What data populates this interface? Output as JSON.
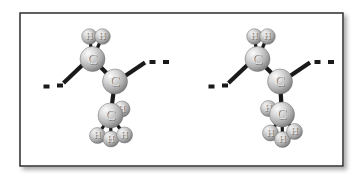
{
  "figure": {
    "name": "molecular-model-figure",
    "caption": "",
    "frame": {
      "x": 20,
      "y": 13,
      "width": 323,
      "height": 153,
      "border_color": "#2b2b2b",
      "border_width": 1.5,
      "background": "#ffffff",
      "shadow_color": "#b9b9b9"
    },
    "atom_colors": {
      "carbon_light": "#f2f2f2",
      "carbon_mid": "#bdbdbd",
      "carbon_dark": "#7a7a7a",
      "hydrogen_light": "#ededed",
      "hydrogen_mid": "#b5b5b5",
      "hydrogen_dark": "#777777",
      "bond": "#1a1a1a",
      "label": "#e8e8e8",
      "label_shadow": "#6f6f6f"
    }
  },
  "molecules": [
    {
      "id": "molecule-left",
      "label": "left-conformer",
      "atoms": [
        {
          "id": "h-top-left",
          "element": "H",
          "cx": 89.5,
          "cy": 36.5,
          "r": 7.8
        },
        {
          "id": "h-top-right",
          "element": "H",
          "cx": 102.5,
          "cy": 36.5,
          "r": 7.8
        },
        {
          "id": "c-upper",
          "element": "C",
          "cx": 92.5,
          "cy": 59.0,
          "r": 12.5
        },
        {
          "id": "c-center",
          "element": "C",
          "cx": 115.0,
          "cy": 81.5,
          "r": 12.5
        },
        {
          "id": "h-methyl-side",
          "element": "H",
          "cx": 122.0,
          "cy": 109.0,
          "r": 8.0
        },
        {
          "id": "c-lower",
          "element": "C",
          "cx": 110.5,
          "cy": 115.5,
          "r": 12.5
        },
        {
          "id": "h-bottom-left",
          "element": "H",
          "cx": 97.5,
          "cy": 135.5,
          "r": 8.0
        },
        {
          "id": "h-bottom-mid",
          "element": "H",
          "cx": 111.0,
          "cy": 139.0,
          "r": 8.0
        },
        {
          "id": "h-bottom-right",
          "element": "H",
          "cx": 124.5,
          "cy": 135.0,
          "r": 8.0
        }
      ],
      "bonds": [
        {
          "id": "bond-c-upper-h-left",
          "from": "c-upper",
          "to": "h-top-left",
          "width": 3.2
        },
        {
          "id": "bond-c-upper-h-right",
          "from": "c-upper",
          "to": "h-top-right",
          "width": 3.2
        },
        {
          "id": "bond-c-upper-c-center",
          "from": "c-upper",
          "to": "c-center",
          "width": 4.2
        },
        {
          "id": "bond-c-center-c-lower",
          "from": "c-center",
          "to": "c-lower",
          "width": 4.2
        },
        {
          "id": "bond-c-lower-h-side",
          "from": "c-lower",
          "to": "h-methyl-side",
          "width": 3.2
        },
        {
          "id": "bond-c-lower-h-bl",
          "from": "c-lower",
          "to": "h-bottom-left",
          "width": 3.2
        },
        {
          "id": "bond-c-lower-h-bm",
          "from": "c-lower",
          "to": "h-bottom-mid",
          "width": 3.2
        },
        {
          "id": "bond-c-lower-h-br",
          "from": "c-lower",
          "to": "h-bottom-right",
          "width": 3.2
        }
      ],
      "chain_bonds": [
        {
          "id": "chain-bond-left",
          "stub": {
            "x1": 83.0,
            "y1": 64.5,
            "x2": 63.5,
            "y2": 83.0,
            "width": 4.2
          },
          "dashes": [
            {
              "x": 57.0,
              "y": 83.5,
              "w": 6.0,
              "h": 4.0
            },
            {
              "x": 43.5,
              "y": 84.5,
              "w": 6.0,
              "h": 4.0
            }
          ]
        },
        {
          "id": "chain-bond-right",
          "stub": {
            "x1": 125.0,
            "y1": 76.0,
            "x2": 145.0,
            "y2": 62.5,
            "width": 4.2
          },
          "dashes": [
            {
              "x": 149.5,
              "y": 60.0,
              "w": 6.0,
              "h": 4.0
            },
            {
              "x": 163.0,
              "y": 60.0,
              "w": 6.0,
              "h": 4.0
            }
          ]
        }
      ]
    },
    {
      "id": "molecule-right",
      "label": "right-conformer",
      "atoms": [
        {
          "id": "h-top-left",
          "element": "H",
          "cx": 254.5,
          "cy": 36.5,
          "r": 7.8
        },
        {
          "id": "h-top-right",
          "element": "H",
          "cx": 267.5,
          "cy": 36.5,
          "r": 7.8
        },
        {
          "id": "c-upper",
          "element": "C",
          "cx": 257.5,
          "cy": 59.0,
          "r": 12.5
        },
        {
          "id": "c-center",
          "element": "C",
          "cx": 280.0,
          "cy": 81.5,
          "r": 12.5
        },
        {
          "id": "h-methyl-side",
          "element": "H",
          "cx": 268.5,
          "cy": 108.5,
          "r": 8.0
        },
        {
          "id": "c-lower",
          "element": "C",
          "cx": 282.0,
          "cy": 114.5,
          "r": 12.5
        },
        {
          "id": "h-bottom-left",
          "element": "H",
          "cx": 270.5,
          "cy": 133.0,
          "r": 8.0
        },
        {
          "id": "h-bottom-mid",
          "element": "H",
          "cx": 282.5,
          "cy": 139.5,
          "r": 8.0
        },
        {
          "id": "h-bottom-right",
          "element": "H",
          "cx": 294.5,
          "cy": 131.5,
          "r": 8.0
        }
      ],
      "bonds": [
        {
          "id": "bond-c-upper-h-left",
          "from": "c-upper",
          "to": "h-top-left",
          "width": 3.2
        },
        {
          "id": "bond-c-upper-h-right",
          "from": "c-upper",
          "to": "h-top-right",
          "width": 3.2
        },
        {
          "id": "bond-c-upper-c-center",
          "from": "c-upper",
          "to": "c-center",
          "width": 4.2
        },
        {
          "id": "bond-c-center-c-lower",
          "from": "c-center",
          "to": "c-lower",
          "width": 4.2
        },
        {
          "id": "bond-c-lower-h-side",
          "from": "c-lower",
          "to": "h-methyl-side",
          "width": 3.2
        },
        {
          "id": "bond-c-lower-h-bl",
          "from": "c-lower",
          "to": "h-bottom-left",
          "width": 3.2
        },
        {
          "id": "bond-c-lower-h-bm",
          "from": "c-lower",
          "to": "h-bottom-mid",
          "width": 3.2
        },
        {
          "id": "bond-c-lower-h-br",
          "from": "c-lower",
          "to": "h-bottom-right",
          "width": 3.2
        }
      ],
      "chain_bonds": [
        {
          "id": "chain-bond-left",
          "stub": {
            "x1": 248.0,
            "y1": 64.5,
            "x2": 228.5,
            "y2": 83.0,
            "width": 4.2
          },
          "dashes": [
            {
              "x": 222.0,
              "y": 83.5,
              "w": 6.0,
              "h": 4.0
            },
            {
              "x": 208.5,
              "y": 84.5,
              "w": 6.0,
              "h": 4.0
            }
          ]
        },
        {
          "id": "chain-bond-right",
          "stub": {
            "x1": 290.0,
            "y1": 76.0,
            "x2": 310.0,
            "y2": 62.5,
            "width": 4.2
          },
          "dashes": [
            {
              "x": 314.5,
              "y": 60.0,
              "w": 6.0,
              "h": 4.0
            },
            {
              "x": 328.0,
              "y": 60.0,
              "w": 6.0,
              "h": 4.0
            }
          ]
        }
      ]
    }
  ]
}
